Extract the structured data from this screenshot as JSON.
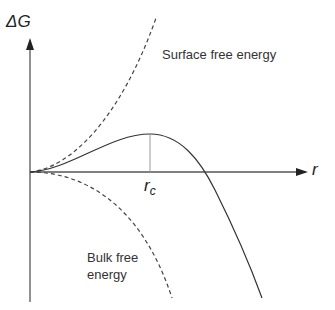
{
  "diagram": {
    "y_axis_label": "ΔG",
    "x_axis_label": "r",
    "critical_radius_label": "r",
    "critical_radius_sub": "c",
    "curves": [
      {
        "name": "Surface free energy",
        "style": "dashed",
        "trend": "increasing ~ r^2"
      },
      {
        "name": "Bulk free energy",
        "style": "dashed",
        "trend": "decreasing ~ -r^3"
      },
      {
        "name": "Total ΔG",
        "style": "solid",
        "trend": "rises to maximum at r_c then falls"
      }
    ],
    "labels": {
      "surface": "Surface free energy",
      "bulk_line1": "Bulk free",
      "bulk_line2": "energy"
    }
  }
}
